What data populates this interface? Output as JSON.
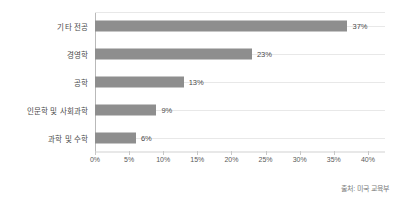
{
  "chart_data": {
    "type": "bar",
    "orientation": "horizontal",
    "title": "",
    "subtitle": "",
    "xlabel": "",
    "ylabel": "",
    "categories": [
      "기타 전공",
      "경영학",
      "공학",
      "인문학 및 사회과학",
      "과학 및 수학"
    ],
    "values": [
      37,
      23,
      13,
      9,
      6
    ],
    "value_labels": [
      "37%",
      "23%",
      "13%",
      "9%",
      "6%"
    ],
    "xlim": [
      0,
      42.5
    ],
    "xticks": [
      0,
      5,
      10,
      15,
      20,
      25,
      30,
      35,
      40
    ],
    "xtick_labels": [
      "0%",
      "5%",
      "10%",
      "15%",
      "20%",
      "25%",
      "30%",
      "35%",
      "40%"
    ],
    "grid": "horizontal",
    "legend": "none",
    "bar_color": "#8e8e8e",
    "gridline_color": "#e8e8e8",
    "axis_color": "#c8c8c8",
    "text_color": "#4a4a4a",
    "background": "#ffffff",
    "annotations": [
      "출처: 미국 교육부"
    ]
  },
  "footer": {
    "source": "출처: 미국 교육부"
  }
}
